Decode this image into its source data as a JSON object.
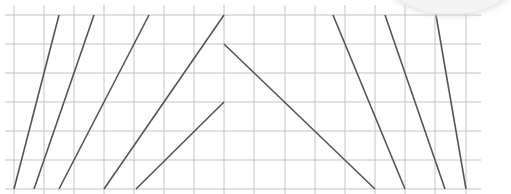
{
  "diagram": {
    "type": "grid-with-line-segments",
    "colors": {
      "grid": "#c4c4c4",
      "segment": "#555555",
      "background": "#ffffff"
    },
    "grid": {
      "vertical_x": [
        14,
        44,
        74,
        104,
        134,
        164,
        194,
        224,
        254,
        285,
        315,
        345,
        375,
        405,
        435,
        466
      ],
      "horizontal_y": [
        15,
        44,
        73,
        102,
        131,
        160,
        189
      ],
      "x_start": 5,
      "x_end": 481,
      "y_start": 5,
      "y_end": 194
    },
    "segments": [
      {
        "x1": 14,
        "y1": 189,
        "x2": 59,
        "y2": 15
      },
      {
        "x1": 34,
        "y1": 189,
        "x2": 94,
        "y2": 15
      },
      {
        "x1": 59,
        "y1": 189,
        "x2": 149,
        "y2": 15
      },
      {
        "x1": 104,
        "y1": 189,
        "x2": 224,
        "y2": 15
      },
      {
        "x1": 136,
        "y1": 189,
        "x2": 224,
        "y2": 102
      },
      {
        "x1": 224,
        "y1": 44,
        "x2": 375,
        "y2": 189
      },
      {
        "x1": 333,
        "y1": 15,
        "x2": 405,
        "y2": 189
      },
      {
        "x1": 385,
        "y1": 15,
        "x2": 445,
        "y2": 189
      },
      {
        "x1": 436,
        "y1": 15,
        "x2": 466,
        "y2": 189
      }
    ]
  }
}
